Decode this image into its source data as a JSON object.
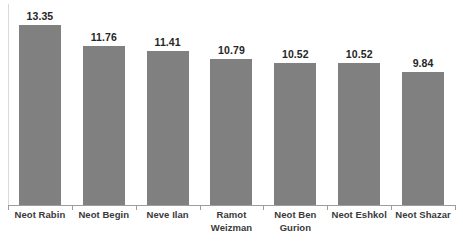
{
  "chart_data": {
    "type": "bar",
    "title": "",
    "subtitle": "",
    "xlabel": "",
    "ylabel": "",
    "categories": [
      "Neot Rabin",
      "Neot Begin",
      "Neve Ilan",
      "Ramot Weizman",
      "Neot Ben Gurion",
      "Neot Eshkol",
      "Neot Shazar"
    ],
    "category_lines": [
      [
        "Neot Rabin"
      ],
      [
        "Neot Begin"
      ],
      [
        "Neve Ilan"
      ],
      [
        "Ramot",
        "Weizman"
      ],
      [
        "Neot Ben",
        "Gurion"
      ],
      [
        "Neot Eshkol"
      ],
      [
        "Neot Shazar"
      ]
    ],
    "values": [
      13.35,
      11.76,
      11.41,
      10.79,
      10.52,
      10.52,
      9.84
    ],
    "value_labels": [
      "13.35",
      "11.76",
      "11.41",
      "10.79",
      "10.52",
      "10.52",
      "9.84"
    ],
    "ylim": [
      0,
      14.9
    ],
    "grid": false,
    "legend": false,
    "legend_position": "none",
    "bar_color": "#808080",
    "value_label_color": "#262626",
    "category_label_color": "#3a3a3a",
    "axis_color": "#9c9c9c",
    "background_color": "#ffffff"
  }
}
